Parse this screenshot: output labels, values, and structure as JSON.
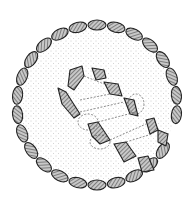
{
  "figure": {
    "title": "",
    "colors": {
      "stone_fill": "#9a9a9a",
      "outline": "#222222",
      "stipple": "#b0b0b0",
      "background": "#ffffff"
    },
    "elements": [
      "outer-kerb-ring",
      "stippled-interior",
      "chamber-stones",
      "dashed-stone-sockets"
    ]
  }
}
